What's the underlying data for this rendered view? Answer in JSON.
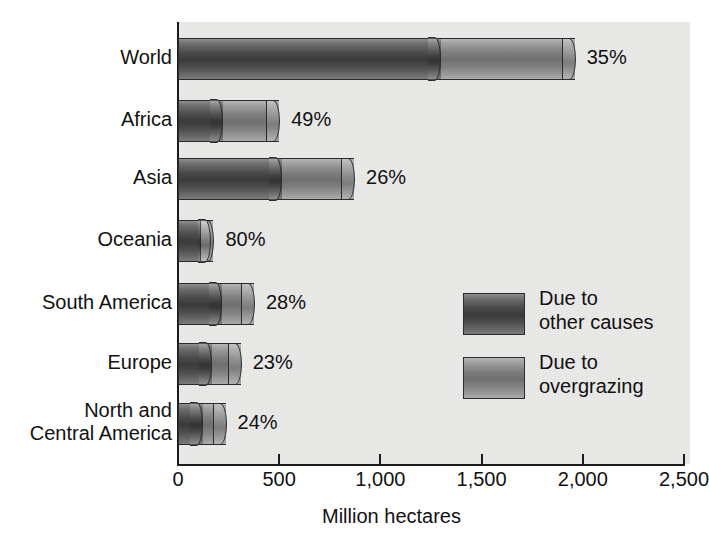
{
  "chart_data": {
    "type": "bar",
    "orientation": "horizontal",
    "stacked": true,
    "title": "",
    "xlabel": "Million hectares",
    "ylabel": "",
    "xlim": [
      0,
      2500
    ],
    "grid": false,
    "legend_position": "inside-right",
    "categories": [
      "World",
      "Africa",
      "Asia",
      "Oceania",
      "South America",
      "Europe",
      "North and\nCentral America"
    ],
    "x_ticks": [
      0,
      500,
      1000,
      1500,
      2000,
      2500
    ],
    "x_tick_labels": [
      "0",
      "500",
      "1,000",
      "1,500",
      "2,000",
      "2,500"
    ],
    "series": [
      {
        "name": "Due to overgrazing",
        "color": "#454545",
        "values": [
          1300,
          220,
          515,
          165,
          215,
          170,
          125
        ]
      },
      {
        "name": "Due to other causes",
        "color": "#7e7e7e",
        "values": [
          660,
          280,
          355,
          10,
          160,
          140,
          110
        ]
      }
    ],
    "totals": [
      1960,
      500,
      870,
      175,
      375,
      310,
      235
    ],
    "data_labels": [
      "35%",
      "49%",
      "26%",
      "80%",
      "28%",
      "23%",
      "24%"
    ],
    "annotations": [
      "Percent labels show the share of degraded land due to overgrazing relative to all causes"
    ]
  },
  "legend": {
    "items": [
      {
        "label": "Due to\nother causes",
        "swatch": "dark"
      },
      {
        "label": "Due to\novergrazing",
        "swatch": "light"
      }
    ]
  },
  "axis": {
    "x_title": "Million hectares"
  },
  "colors": {
    "panel_background": "#e9e9e7",
    "page_background": "#ffffff",
    "axis": "#1b1b1b",
    "text": "#111111",
    "bar_dark": "#454545",
    "bar_light": "#7e7e7e"
  }
}
